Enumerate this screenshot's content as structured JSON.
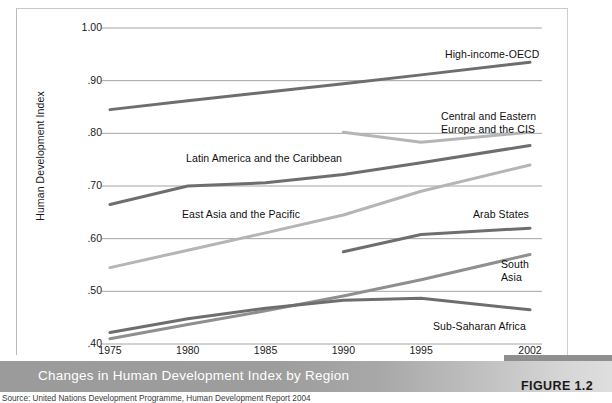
{
  "figure": {
    "caption": "Changes in Human Development Index by Region",
    "tag": "FIGURE 1.2",
    "source": "Source: United Nations Development Programme, Human Development Report 2004",
    "caption_band_color": "#9b9b9b",
    "caption_text_color": "#ffffff"
  },
  "chart_data": {
    "type": "line",
    "title": "Changes in Human Development Index by Region",
    "xlabel": "",
    "ylabel": "Human Development Index",
    "x": [
      1975,
      1980,
      1985,
      1990,
      1995,
      2002
    ],
    "xtick_labels": [
      "1975",
      "1980",
      "1985",
      "1990",
      "1995",
      "2002"
    ],
    "xlim": [
      1975,
      2002
    ],
    "ylim": [
      0.4,
      1.0
    ],
    "ytick_labels": [
      "1.00",
      ".90",
      ".80",
      ".70",
      ".60",
      ".50",
      ".40"
    ],
    "ytick_values": [
      1.0,
      0.9,
      0.8,
      0.7,
      0.6,
      0.5,
      0.4
    ],
    "grid": true,
    "grid_color": "#8d8d8d",
    "legend": "inline-annotations",
    "series": [
      {
        "name": "High-income-OECD",
        "color": "#6e6e6e",
        "x": [
          1975,
          1980,
          1985,
          1990,
          1995,
          2002
        ],
        "values": [
          0.845,
          0.862,
          0.878,
          0.894,
          0.911,
          0.935
        ],
        "label_x": 445,
        "label_y": 48,
        "label_align": "left"
      },
      {
        "name": "Central and Eastern\nEurope and the CIS",
        "color": "#b5b5b5",
        "x": [
          1990,
          1995,
          2002
        ],
        "values": [
          0.802,
          0.783,
          0.802
        ],
        "label_x": 441,
        "label_y": 110,
        "label_align": "left"
      },
      {
        "name": "Latin America and the Caribbean",
        "color": "#6e6e6e",
        "x": [
          1975,
          1980,
          1985,
          1990,
          1995,
          2002
        ],
        "values": [
          0.665,
          0.7,
          0.706,
          0.722,
          0.744,
          0.777
        ],
        "label_x": 186,
        "label_y": 152,
        "label_align": "left"
      },
      {
        "name": "East Asia and the Pacific",
        "color": "#b5b5b5",
        "x": [
          1975,
          1980,
          1985,
          1990,
          1995,
          2002
        ],
        "values": [
          0.545,
          0.578,
          0.611,
          0.645,
          0.69,
          0.74
        ],
        "label_x": 182,
        "label_y": 208,
        "label_align": "left"
      },
      {
        "name": "Arab States",
        "color": "#6e6e6e",
        "x": [
          1990,
          1995,
          2002
        ],
        "values": [
          0.575,
          0.608,
          0.62
        ],
        "label_x": 473,
        "label_y": 208,
        "label_align": "left"
      },
      {
        "name": "South\nAsia",
        "color": "#8f8f8f",
        "x": [
          1975,
          1980,
          1985,
          1990,
          1995,
          2002
        ],
        "values": [
          0.41,
          0.437,
          0.463,
          0.491,
          0.522,
          0.57
        ],
        "label_x": 501,
        "label_y": 258,
        "label_align": "left"
      },
      {
        "name": "Sub-Saharan Africa",
        "color": "#6e6e6e",
        "x": [
          1975,
          1980,
          1985,
          1990,
          1995,
          2002
        ],
        "values": [
          0.422,
          0.448,
          0.468,
          0.483,
          0.487,
          0.465
        ],
        "label_x": 433,
        "label_y": 320,
        "label_align": "left"
      }
    ]
  }
}
